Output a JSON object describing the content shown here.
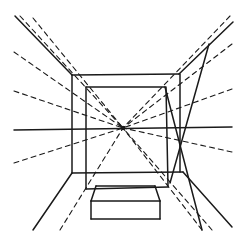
{
  "figure": {
    "width": 246,
    "height": 240,
    "stroke_color": "#1a1a1a",
    "background": "#ffffff",
    "vanishing_point": {
      "x": 123,
      "y": 128
    },
    "solid_lines": [
      {
        "id": "horizon",
        "x1": 14,
        "y1": 130,
        "x2": 232,
        "y2": 127
      },
      {
        "id": "ceiling-left-edge",
        "x1": 15,
        "y1": 16,
        "x2": 72,
        "y2": 75
      },
      {
        "id": "floor-left-edge",
        "x1": 72,
        "y1": 173,
        "x2": 33,
        "y2": 230
      },
      {
        "id": "outer-top",
        "x1": 72,
        "y1": 75,
        "x2": 179,
        "y2": 74
      },
      {
        "id": "outer-left",
        "x1": 72,
        "y1": 75,
        "x2": 72,
        "y2": 173
      },
      {
        "id": "outer-bottom",
        "x1": 72,
        "y1": 173,
        "x2": 183,
        "y2": 172
      },
      {
        "id": "outer-right",
        "x1": 180,
        "y1": 74,
        "x2": 180,
        "y2": 172
      },
      {
        "id": "inner-top",
        "x1": 86,
        "y1": 87,
        "x2": 165,
        "y2": 87
      },
      {
        "id": "inner-left",
        "x1": 86,
        "y1": 87,
        "x2": 86,
        "y2": 189
      },
      {
        "id": "inner-right",
        "x1": 166,
        "y1": 87,
        "x2": 168,
        "y2": 186
      },
      {
        "id": "inner-bottom",
        "x1": 86,
        "y1": 189,
        "x2": 168,
        "y2": 187
      },
      {
        "id": "ceiling-right-edge",
        "x1": 179,
        "y1": 74,
        "x2": 233,
        "y2": 22
      },
      {
        "id": "floor-right-edge",
        "x1": 183,
        "y1": 172,
        "x2": 232,
        "y2": 227
      },
      {
        "id": "door-diagonal-1",
        "x1": 209,
        "y1": 44,
        "x2": 170,
        "y2": 183
      },
      {
        "id": "door-diagonal-2",
        "x1": 165,
        "y1": 87,
        "x2": 202,
        "y2": 230
      },
      {
        "id": "box-back-top",
        "x1": 96,
        "y1": 186,
        "x2": 155,
        "y2": 186
      },
      {
        "id": "box-front-top",
        "x1": 91,
        "y1": 201,
        "x2": 160,
        "y2": 201
      },
      {
        "id": "box-left-top",
        "x1": 96,
        "y1": 186,
        "x2": 91,
        "y2": 201
      },
      {
        "id": "box-right-top",
        "x1": 155,
        "y1": 186,
        "x2": 160,
        "y2": 201
      },
      {
        "id": "box-front-left",
        "x1": 91,
        "y1": 201,
        "x2": 91,
        "y2": 219
      },
      {
        "id": "box-front-right",
        "x1": 160,
        "y1": 201,
        "x2": 160,
        "y2": 219
      },
      {
        "id": "box-front-bottom",
        "x1": 91,
        "y1": 219,
        "x2": 160,
        "y2": 219
      }
    ],
    "dashed_lines": [
      {
        "id": "ortho-top-left-1",
        "x1": 20,
        "y1": 16,
        "x2": 123,
        "y2": 128
      },
      {
        "id": "ortho-top-left-2",
        "x1": 33,
        "y1": 18,
        "x2": 123,
        "y2": 128
      },
      {
        "id": "ortho-left-upper",
        "x1": 14,
        "y1": 52,
        "x2": 123,
        "y2": 128
      },
      {
        "id": "ortho-left-mid",
        "x1": 14,
        "y1": 91,
        "x2": 123,
        "y2": 128
      },
      {
        "id": "ortho-left-lower",
        "x1": 14,
        "y1": 163,
        "x2": 123,
        "y2": 128
      },
      {
        "id": "ortho-bottom-left",
        "x1": 60,
        "y1": 230,
        "x2": 123,
        "y2": 128
      },
      {
        "id": "ortho-bottom-right-1",
        "x1": 202,
        "y1": 230,
        "x2": 123,
        "y2": 128
      },
      {
        "id": "ortho-bottom-right-2",
        "x1": 212,
        "y1": 230,
        "x2": 123,
        "y2": 128
      },
      {
        "id": "ortho-right-lower",
        "x1": 232,
        "y1": 152,
        "x2": 123,
        "y2": 128
      },
      {
        "id": "ortho-right-mid",
        "x1": 232,
        "y1": 89,
        "x2": 123,
        "y2": 128
      },
      {
        "id": "ortho-right-upper",
        "x1": 232,
        "y1": 44,
        "x2": 123,
        "y2": 128
      },
      {
        "id": "ortho-top-right",
        "x1": 230,
        "y1": 16,
        "x2": 123,
        "y2": 128
      }
    ]
  }
}
